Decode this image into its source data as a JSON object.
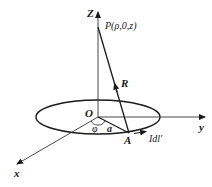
{
  "diagram": {
    "labels": {
      "z_axis": "Z",
      "y_axis": "y",
      "x_axis": "x",
      "origin": "O",
      "point_p": "P(ρ,0,z)",
      "vector_r": "R",
      "point_a": "A",
      "radius": "a",
      "angle": "φ",
      "current_element": "Idl'"
    },
    "colors": {
      "line": "#1a1a1a",
      "axis": "#333333",
      "background": "#ffffff"
    }
  }
}
